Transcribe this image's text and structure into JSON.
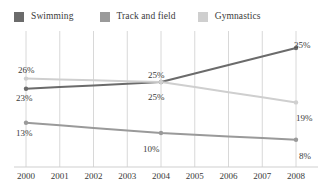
{
  "legend": {
    "position": "top-left",
    "items": [
      {
        "label": "Swimming",
        "color": "#6b6b6b",
        "swatch_name": "legend-swatch-swimming"
      },
      {
        "label": "Track and field",
        "color": "#9a9a9a",
        "swatch_name": "legend-swatch-track-and-field"
      },
      {
        "label": "Gymnastics",
        "color": "#cfcfcf",
        "swatch_name": "legend-swatch-gymnastics"
      }
    ]
  },
  "axis": {
    "x_tick_labels": [
      "2000",
      "2001",
      "2002",
      "2003",
      "2004",
      "2005",
      "2006",
      "2007",
      "2008"
    ]
  },
  "value_labels": [
    {
      "text": "26%",
      "name": "label-gymnastics-2000"
    },
    {
      "text": "23%",
      "name": "label-swimming-2000"
    },
    {
      "text": "13%",
      "name": "label-track-and-field-2000"
    },
    {
      "text": "25%",
      "name": "label-swimming-2004"
    },
    {
      "text": "25%",
      "name": "label-gymnastics-2004"
    },
    {
      "text": "10%",
      "name": "label-track-and-field-2004"
    },
    {
      "text": "35%",
      "name": "label-swimming-2008"
    },
    {
      "text": "19%",
      "name": "label-gymnastics-2008"
    },
    {
      "text": "8%",
      "name": "label-track-and-field-2008"
    }
  ],
  "chart_data": {
    "type": "line",
    "title": "",
    "subtitle": "",
    "xlabel": "",
    "ylabel": "",
    "x": [
      2000,
      2001,
      2002,
      2003,
      2004,
      2005,
      2006,
      2007,
      2008
    ],
    "categories": [
      "2000",
      "2001",
      "2002",
      "2003",
      "2004",
      "2005",
      "2006",
      "2007",
      "2008"
    ],
    "xlim": [
      2000,
      2008
    ],
    "ylim": [
      0,
      40
    ],
    "grid": {
      "vertical": true,
      "horizontal": false
    },
    "legend_position": "top-left",
    "units": "percent",
    "labeled_points": [
      2000,
      2004,
      2008
    ],
    "series": [
      {
        "name": "Swimming",
        "color": "#6b6b6b",
        "values": [
          23,
          23.5,
          24,
          24.5,
          25,
          27.5,
          30,
          32.5,
          35
        ],
        "labeled_values": {
          "2000": 23,
          "2004": 25,
          "2008": 35
        }
      },
      {
        "name": "Track and field",
        "color": "#9a9a9a",
        "values": [
          13,
          12.25,
          11.5,
          10.75,
          10,
          9.5,
          9,
          8.5,
          8
        ],
        "labeled_values": {
          "2000": 13,
          "2004": 10,
          "2008": 8
        }
      },
      {
        "name": "Gymnastics",
        "color": "#cfcfcf",
        "values": [
          26,
          25.75,
          25.5,
          25.25,
          25,
          23.5,
          22,
          20.5,
          19
        ],
        "labeled_values": {
          "2000": 26,
          "2004": 25,
          "2008": 19
        }
      }
    ]
  }
}
